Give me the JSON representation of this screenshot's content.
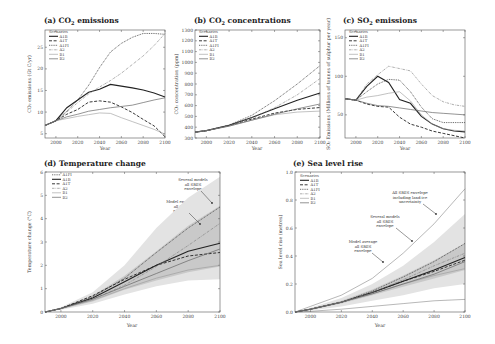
{
  "chart_data": [
    {
      "id": "a",
      "type": "line",
      "title": "(a) CO2 emissions",
      "xlabel": "Year",
      "ylabel": "CO2 emissions (Gt C/yr)",
      "xlim": [
        1990,
        2100
      ],
      "ylim": [
        4,
        29
      ],
      "xticks": [
        2000,
        2020,
        2040,
        2060,
        2080,
        2100
      ],
      "yticks": [
        5,
        10,
        15,
        20,
        25
      ],
      "legend_title": "Scenarios",
      "legend": [
        "A1B",
        "A1T",
        "A1FI",
        "A2",
        "B1",
        "B2"
      ],
      "x": [
        1990,
        2000,
        2010,
        2020,
        2030,
        2040,
        2050,
        2060,
        2070,
        2080,
        2090,
        2100
      ],
      "series": [
        {
          "name": "A1B",
          "style": "solid-thick",
          "values": [
            6.9,
            8.0,
            11.0,
            12.8,
            14.6,
            15.3,
            16.4,
            16.0,
            15.6,
            15.1,
            14.4,
            13.5
          ]
        },
        {
          "name": "A1T",
          "style": "dashed",
          "values": [
            6.9,
            8.0,
            9.5,
            10.6,
            12.3,
            12.6,
            12.3,
            11.2,
            9.9,
            8.3,
            6.8,
            4.3
          ]
        },
        {
          "name": "A1FI",
          "style": "dotted",
          "values": [
            6.9,
            8.0,
            10.2,
            12.8,
            16.2,
            20.3,
            23.9,
            25.9,
            27.3,
            28.2,
            28.2,
            28.0
          ]
        },
        {
          "name": "A2",
          "style": "dash-dot",
          "values": [
            6.9,
            8.0,
            10.0,
            12.2,
            14.2,
            15.8,
            17.3,
            19.0,
            21.0,
            23.0,
            25.4,
            28.2
          ]
        },
        {
          "name": "B1",
          "style": "thin-light",
          "values": [
            6.9,
            8.0,
            8.5,
            9.0,
            9.4,
            9.8,
            9.7,
            8.7,
            7.8,
            6.9,
            6.0,
            4.9
          ]
        },
        {
          "name": "B2",
          "style": "solid-gray",
          "values": [
            6.9,
            8.0,
            8.9,
            9.5,
            10.2,
            10.6,
            11.0,
            11.3,
            11.6,
            12.2,
            12.8,
            13.3
          ]
        }
      ]
    },
    {
      "id": "b",
      "type": "line",
      "title": "(b) CO2 concentrations",
      "xlabel": "Year",
      "ylabel": "CO2 concentration (ppm)",
      "xlim": [
        1990,
        2100
      ],
      "ylim": [
        300,
        1300
      ],
      "xticks": [
        2000,
        2020,
        2040,
        2060,
        2080,
        2100
      ],
      "yticks": [
        300,
        400,
        500,
        600,
        700,
        800,
        900,
        1000,
        1100,
        1200,
        1300
      ],
      "legend_title": "Scenarios",
      "legend": [
        "A1B",
        "A1T",
        "A1FI",
        "A2",
        "B1",
        "B2"
      ],
      "x": [
        1990,
        2000,
        2020,
        2040,
        2060,
        2080,
        2100
      ],
      "series": [
        {
          "name": "A1B",
          "style": "solid-thick",
          "values": [
            354,
            368,
            418,
            490,
            570,
            650,
            717
          ]
        },
        {
          "name": "A1T",
          "style": "dashed",
          "values": [
            354,
            368,
            415,
            475,
            530,
            565,
            582
          ]
        },
        {
          "name": "A1FI",
          "style": "dotted",
          "values": [
            354,
            368,
            420,
            510,
            645,
            800,
            970
          ]
        },
        {
          "name": "A2",
          "style": "dash-dot",
          "values": [
            354,
            368,
            415,
            485,
            580,
            700,
            850
          ]
        },
        {
          "name": "B1",
          "style": "thin-light",
          "values": [
            354,
            368,
            410,
            465,
            515,
            540,
            549
          ]
        },
        {
          "name": "B2",
          "style": "solid-gray",
          "values": [
            354,
            368,
            410,
            465,
            520,
            570,
            615
          ]
        }
      ]
    },
    {
      "id": "c",
      "type": "line",
      "title": "(c) SO2 emissions",
      "xlabel": "Year",
      "ylabel": "SO2 Emissions (Millions of tonnes of sulphur per year)",
      "xlim": [
        1990,
        2100
      ],
      "ylim": [
        20,
        160
      ],
      "xticks": [
        2000,
        2020,
        2040,
        2060,
        2080,
        2100
      ],
      "yticks": [
        50,
        100,
        150
      ],
      "legend_title": "Scenarios",
      "legend": [
        "A1B",
        "A1T",
        "A1FI",
        "A2",
        "B1",
        "B2"
      ],
      "x": [
        1990,
        2000,
        2010,
        2020,
        2030,
        2040,
        2050,
        2060,
        2070,
        2080,
        2090,
        2100
      ],
      "series": [
        {
          "name": "A1B",
          "style": "solid-thick",
          "values": [
            71,
            69,
            87,
            100,
            92,
            70,
            65,
            48,
            38,
            32,
            29,
            28
          ]
        },
        {
          "name": "A1T",
          "style": "dashed",
          "values": [
            71,
            69,
            64,
            61,
            60,
            47,
            38,
            34,
            29,
            26,
            23,
            20
          ]
        },
        {
          "name": "A1FI",
          "style": "dotted",
          "values": [
            71,
            69,
            80,
            90,
            96,
            95,
            80,
            60,
            45,
            40,
            40,
            40
          ]
        },
        {
          "name": "A2",
          "style": "dash-dot",
          "values": [
            71,
            69,
            90,
            102,
            113,
            110,
            107,
            90,
            75,
            67,
            63,
            61
          ]
        },
        {
          "name": "B1",
          "style": "thin-light",
          "values": [
            71,
            69,
            73,
            75,
            78,
            80,
            68,
            50,
            38,
            32,
            30,
            29
          ]
        },
        {
          "name": "B2",
          "style": "solid-gray",
          "values": [
            71,
            69,
            65,
            62,
            61,
            59,
            57,
            55,
            53,
            52,
            51,
            50
          ]
        }
      ]
    },
    {
      "id": "d",
      "type": "line",
      "title": "(d) Temperature change",
      "xlabel": "Year",
      "ylabel": "Temperature change (°C)",
      "xlim": [
        1990,
        2100
      ],
      "ylim": [
        0,
        6
      ],
      "xticks": [
        2000,
        2020,
        2040,
        2060,
        2080,
        2100
      ],
      "yticks": [
        0,
        1,
        2,
        3,
        4,
        5,
        6
      ],
      "legend": [
        "A1FI",
        "A1B",
        "A1T",
        "A2",
        "B1",
        "B2"
      ],
      "annotations": [
        "Several models all SRES envelope",
        "Model ensemble all SRES envelope"
      ],
      "x": [
        1990,
        2000,
        2020,
        2040,
        2060,
        2080,
        2100
      ],
      "series": [
        {
          "name": "A1FI",
          "style": "dotted",
          "values": [
            0,
            0.15,
            0.65,
            1.45,
            2.55,
            3.6,
            4.5
          ]
        },
        {
          "name": "A1B",
          "style": "solid-thick",
          "values": [
            0,
            0.15,
            0.6,
            1.3,
            2.0,
            2.6,
            2.95
          ]
        },
        {
          "name": "A1T",
          "style": "dashed",
          "values": [
            0,
            0.15,
            0.7,
            1.4,
            2.0,
            2.4,
            2.55
          ]
        },
        {
          "name": "A2",
          "style": "dash-dot",
          "values": [
            0,
            0.15,
            0.55,
            1.15,
            1.95,
            2.85,
            3.8
          ]
        },
        {
          "name": "B1",
          "style": "thin-light",
          "values": [
            0,
            0.15,
            0.5,
            1.0,
            1.45,
            1.8,
            2.0
          ]
        },
        {
          "name": "B2",
          "style": "solid-gray",
          "values": [
            0,
            0.15,
            0.55,
            1.1,
            1.65,
            2.2,
            2.7
          ]
        }
      ],
      "envelopes": [
        {
          "name": "Several models all SRES envelope",
          "lower": [
            0,
            0.1,
            0.35,
            0.75,
            1.1,
            1.35,
            1.4
          ],
          "upper": [
            0,
            0.2,
            0.85,
            2.0,
            3.6,
            4.9,
            5.8
          ]
        },
        {
          "name": "Model ensemble all SRES envelope",
          "lower": [
            0,
            0.12,
            0.45,
            0.95,
            1.35,
            1.7,
            1.95
          ],
          "upper": [
            0,
            0.18,
            0.7,
            1.55,
            2.6,
            3.7,
            4.55
          ]
        }
      ]
    },
    {
      "id": "e",
      "type": "line",
      "title": "(e) Sea level rise",
      "xlabel": "Year",
      "ylabel": "Sea level rise (metres)",
      "xlim": [
        1990,
        2100
      ],
      "ylim": [
        0,
        1.0
      ],
      "xticks": [
        2000,
        2020,
        2040,
        2060,
        2080,
        2100
      ],
      "yticks": [
        0.0,
        0.2,
        0.4,
        0.6,
        0.8,
        1.0
      ],
      "legend_title": "Scenarios",
      "legend": [
        "A1B",
        "A1T",
        "A1FI",
        "A2",
        "B1",
        "B2"
      ],
      "annotations": [
        "All SRES envelope including land-ice uncertainty",
        "Several models all SRES envelope",
        "Model average all SRES envelope"
      ],
      "x": [
        1990,
        2000,
        2020,
        2040,
        2060,
        2080,
        2100
      ],
      "series": [
        {
          "name": "A1B",
          "style": "solid-thick",
          "values": [
            0,
            0.02,
            0.07,
            0.14,
            0.22,
            0.3,
            0.39
          ]
        },
        {
          "name": "A1T",
          "style": "dashed",
          "values": [
            0,
            0.02,
            0.07,
            0.14,
            0.22,
            0.29,
            0.37
          ]
        },
        {
          "name": "A1FI",
          "style": "dotted",
          "values": [
            0,
            0.02,
            0.07,
            0.15,
            0.25,
            0.36,
            0.49
          ]
        },
        {
          "name": "A2",
          "style": "dash-dot",
          "values": [
            0,
            0.02,
            0.07,
            0.14,
            0.23,
            0.33,
            0.42
          ]
        },
        {
          "name": "B1",
          "style": "thin-light",
          "values": [
            0,
            0.02,
            0.07,
            0.13,
            0.2,
            0.26,
            0.31
          ]
        },
        {
          "name": "B2",
          "style": "solid-gray",
          "values": [
            0,
            0.02,
            0.07,
            0.13,
            0.2,
            0.27,
            0.36
          ]
        }
      ],
      "envelopes": [
        {
          "name": "All SRES envelope including land-ice uncertainty",
          "lower": [
            0,
            0.005,
            0.02,
            0.04,
            0.06,
            0.08,
            0.09
          ],
          "upper": [
            0,
            0.04,
            0.12,
            0.24,
            0.42,
            0.63,
            0.88
          ]
        },
        {
          "name": "Several models all SRES envelope",
          "lower": [
            0,
            0.01,
            0.04,
            0.08,
            0.12,
            0.17,
            0.2
          ],
          "upper": [
            0,
            0.03,
            0.1,
            0.2,
            0.33,
            0.5,
            0.7
          ]
        },
        {
          "name": "Model average all SRES envelope",
          "lower": [
            0,
            0.015,
            0.06,
            0.12,
            0.18,
            0.24,
            0.3
          ],
          "upper": [
            0,
            0.025,
            0.08,
            0.16,
            0.26,
            0.37,
            0.49
          ]
        }
      ]
    }
  ],
  "panels": {
    "a": {
      "title_prefix": "(a) CO",
      "title_sub": "2",
      "title_suffix": " emissions",
      "ylabel": "CO₂ emissions (Gt C/yr)",
      "xlabel": "Year"
    },
    "b": {
      "title_prefix": "(b) CO",
      "title_sub": "2",
      "title_suffix": " concentrations",
      "ylabel": "CO₂ concentration (ppm)",
      "xlabel": "Year"
    },
    "c": {
      "title_prefix": "(c) SO",
      "title_sub": "2",
      "title_suffix": " emissions",
      "ylabel": "SO₂ Emissions (Millions of tonnes of sulphur per year)",
      "xlabel": "Year"
    },
    "d": {
      "title": "(d) Temperature change",
      "ylabel": "Temperature change (°C)",
      "xlabel": "Year",
      "ann1": [
        "Several models",
        "all SRES",
        "envelope"
      ],
      "ann2": [
        "Model ensemble",
        "all SRES",
        "envelope"
      ]
    },
    "e": {
      "title": "(e) Sea level rise",
      "ylabel": "Sea level rise (metres)",
      "xlabel": "Year",
      "ann1": [
        "All SRES envelope",
        "including land-ice",
        "uncertainty"
      ],
      "ann2": [
        "Several models",
        "all SRES",
        "envelope"
      ],
      "ann3": [
        "Model average",
        "all SRES",
        "envelope"
      ]
    }
  },
  "legend_title": "Scenarios"
}
